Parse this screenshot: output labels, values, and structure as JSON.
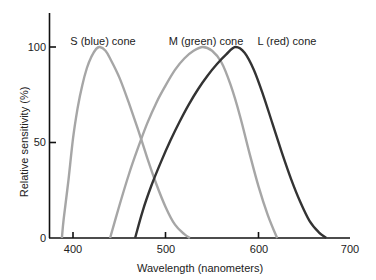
{
  "chart_data": {
    "type": "line",
    "title": "",
    "xlabel": "Wavelength (nanometers)",
    "ylabel": "Relative sensitivity (%)",
    "xlim": [
      375,
      700
    ],
    "ylim": [
      0,
      118
    ],
    "x_ticks": [
      400,
      500,
      600,
      700
    ],
    "y_ticks": [
      0,
      50,
      100
    ],
    "grid": false,
    "legend": "inline labels above peaks",
    "series": [
      {
        "name": "S (blue) cone",
        "color": "#a6a6a6",
        "x": [
          388,
          390,
          395,
          400,
          405,
          410,
          415,
          420,
          425,
          429,
          435,
          440,
          450,
          460,
          470,
          480,
          490,
          500,
          510,
          520,
          526
        ],
        "values": [
          0,
          10,
          30,
          52,
          68,
          80,
          89,
          95,
          99,
          100,
          98,
          94,
          84,
          71,
          57,
          42,
          28,
          16,
          7,
          2,
          0
        ]
      },
      {
        "name": "M (green) cone",
        "color": "#a6a6a6",
        "x": [
          440,
          450,
          460,
          470,
          480,
          490,
          500,
          510,
          520,
          530,
          540,
          550,
          560,
          570,
          580,
          590,
          600,
          610,
          620
        ],
        "values": [
          0,
          17,
          33,
          47,
          60,
          71,
          80,
          88,
          94,
          98,
          100,
          98,
          92,
          80,
          64,
          45,
          27,
          12,
          0
        ]
      },
      {
        "name": "L (red) cone",
        "color": "#333333",
        "x": [
          467,
          475,
          485,
          495,
          505,
          515,
          525,
          535,
          545,
          555,
          565,
          575,
          585,
          595,
          605,
          615,
          625,
          635,
          645,
          655,
          665,
          673
        ],
        "values": [
          0,
          14,
          28,
          40,
          51,
          61,
          70,
          78,
          85,
          91,
          96,
          100,
          97,
          88,
          75,
          60,
          45,
          31,
          19,
          9,
          3,
          0
        ]
      }
    ]
  },
  "labels": {
    "s_cone": "S (blue) cone",
    "m_cone": "M (green) cone",
    "l_cone": "L (red) cone",
    "xlabel": "Wavelength (nanometers)",
    "ylabel": "Relative sensitivity (%)",
    "x_ticks": [
      "400",
      "500",
      "600",
      "700"
    ],
    "y_ticks": [
      "0",
      "50",
      "100"
    ]
  }
}
